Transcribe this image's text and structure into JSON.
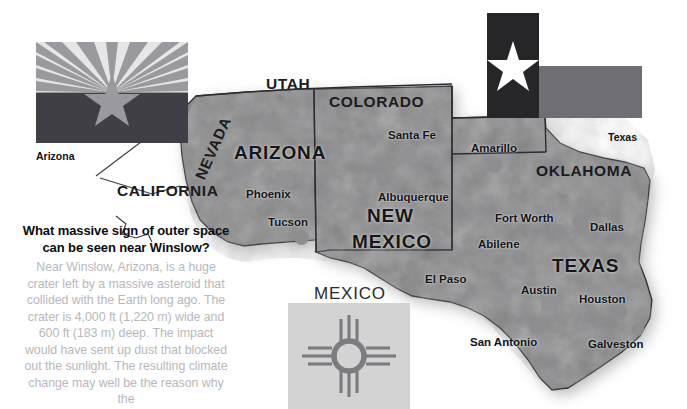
{
  "page": {
    "width": 687,
    "height": 409,
    "background": "#ffffff"
  },
  "flags": [
    {
      "id": "arizona",
      "caption": "Arizona",
      "colors": {
        "ray_dark": "#9a9a9e",
        "ray_light": "#e6e6e6",
        "lower": "#3f3f45",
        "star": "#9a9a9e"
      }
    },
    {
      "id": "texas",
      "caption": "Texas",
      "colors": {
        "hoist": "#262629",
        "upper": "#ffffff",
        "lower": "#6e6e74",
        "star": "#ffffff"
      }
    },
    {
      "id": "newmexico",
      "caption": "",
      "colors": {
        "field": "#d3d3d3",
        "zia": "#7b7b80"
      }
    }
  ],
  "question": {
    "heading": "What massive sign of outer space can be seen near Winslow?",
    "body": "Near Winslow, Arizona, is a huge crater left by a massive asteroid that collided with the Earth long ago. The crater is 4,000 ft (1,220 m) wide and 600 ft (183 m) deep. The impact would have sent up dust that blocked out the sunlight. The resulting climate change may well be the reason why the",
    "heading_color": "#0c0c10",
    "body_color": "#b8b8bc"
  },
  "map": {
    "states": [
      {
        "name": "UTAH",
        "x": 266,
        "y": 75,
        "size": "normal",
        "inside": false
      },
      {
        "name": "COLORADO",
        "x": 329,
        "y": 93,
        "size": "normal",
        "inside": false
      },
      {
        "name": "NEVADA",
        "x": 207,
        "y": 165,
        "size": "normal",
        "inside": false,
        "rotated": true
      },
      {
        "name": "CALIFORNIA",
        "x": 117,
        "y": 182,
        "size": "normal",
        "inside": false
      },
      {
        "name": "OKLAHOMA",
        "x": 536,
        "y": 162,
        "size": "normal",
        "inside": false
      },
      {
        "name": "ARIZONA",
        "x": 234,
        "y": 142,
        "size": "large",
        "inside": true
      },
      {
        "name": "NEW",
        "x": 367,
        "y": 205,
        "size": "large",
        "inside": true
      },
      {
        "name": "MEXICO",
        "x": 352,
        "y": 231,
        "size": "large",
        "inside": true
      },
      {
        "name": "TEXAS",
        "x": 552,
        "y": 255,
        "size": "large",
        "inside": true
      }
    ],
    "country_label": {
      "name": "MEXICO",
      "x": 314,
      "y": 284
    },
    "cities": [
      {
        "name": "Phoenix",
        "label_x": 246,
        "label_y": 188,
        "marker": "square",
        "marker_x": 276,
        "marker_y": 170
      },
      {
        "name": "Tucson",
        "label_x": 268,
        "label_y": 216,
        "marker": "circle",
        "marker_x": 294,
        "marker_y": 230
      },
      {
        "name": "Santa Fe",
        "label_x": 388,
        "label_y": 129,
        "marker": "square",
        "marker_x": 400,
        "marker_y": 146
      },
      {
        "name": "Albuquerque",
        "label_x": 378,
        "label_y": 191,
        "marker": "circle",
        "marker_x": 376,
        "marker_y": 172
      },
      {
        "name": "El Paso",
        "label_x": 425,
        "label_y": 273,
        "marker": "circle",
        "marker_x": 405,
        "marker_y": 260
      },
      {
        "name": "Amarillo",
        "label_x": 471,
        "label_y": 142,
        "marker": "circle",
        "marker_x": 487,
        "marker_y": 158
      },
      {
        "name": "Fort Worth",
        "label_x": 495,
        "label_y": 212,
        "marker": "circle",
        "marker_x": 551,
        "marker_y": 224
      },
      {
        "name": "Dallas",
        "label_x": 590,
        "label_y": 221,
        "marker": "circle",
        "marker_x": 572,
        "marker_y": 215
      },
      {
        "name": "Abilene",
        "label_x": 478,
        "label_y": 238,
        "marker": "circle",
        "marker_x": 512,
        "marker_y": 250
      },
      {
        "name": "Austin",
        "label_x": 521,
        "label_y": 284,
        "marker": "square",
        "marker_x": 541,
        "marker_y": 293
      },
      {
        "name": "San Antonio",
        "label_x": 470,
        "label_y": 336,
        "marker": "circle",
        "marker_x": 529,
        "marker_y": 319
      },
      {
        "name": "Houston",
        "label_x": 579,
        "label_y": 293,
        "marker": "circle",
        "marker_x": 612,
        "marker_y": 305
      },
      {
        "name": "Galveston",
        "label_x": 588,
        "label_y": 338,
        "marker": "circle",
        "marker_x": 631,
        "marker_y": 323
      }
    ],
    "colors": {
      "land": "#8a8a8c",
      "land_light": "#9c9c9e",
      "border": "#2c2c30",
      "marker": "#8e8e90",
      "shadow": "#c9c9cb"
    }
  }
}
